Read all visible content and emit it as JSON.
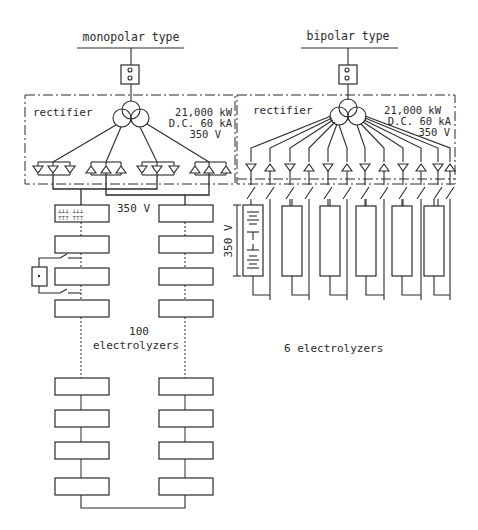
{
  "diagram": {
    "monopolar": {
      "title": "monopolar type",
      "rectifier_label": "rectifier",
      "spec_power": "21,000 kW",
      "spec_current": "D.C. 60 kA",
      "spec_voltage": "350 V",
      "bus_voltage_label": "350 V",
      "count_number": "100",
      "count_label": "electrolyzers",
      "rectifier_groups": 4,
      "elements_per_group": 3,
      "electrolyzer_columns": 2
    },
    "bipolar": {
      "title": "bipolar type",
      "rectifier_label": "rectifier",
      "spec_power": "21,000 kW",
      "spec_current": "D.C. 60 kA",
      "spec_voltage": "350 V",
      "cell_voltage_label": "350 V",
      "count_label": "6 electrolyzers",
      "rectifier_elements": 12,
      "electrolyzer_count": 6
    },
    "colors": {
      "ink": "#2a2a2a",
      "paper": "#ffffff"
    }
  }
}
